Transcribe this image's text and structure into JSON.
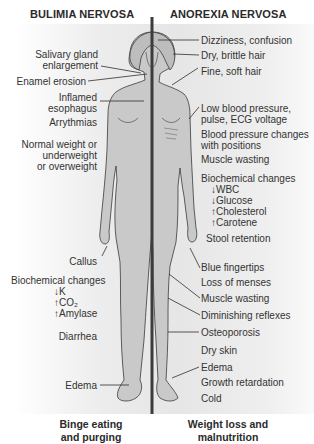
{
  "titles": {
    "left": "BULIMIA NERVOSA",
    "right": "ANOREXIA NERVOSA"
  },
  "bulimia": {
    "labels": [
      {
        "line1": "Salivary gland",
        "line2": "enlargement"
      },
      {
        "line1": "Enamel erosion"
      },
      {
        "line1": "Inflamed",
        "line2": "esophagus"
      },
      {
        "line1": "Arrythmias"
      },
      {
        "line1": "Normal weight or",
        "line2": "underweight",
        "line3": "or overweight"
      },
      {
        "line1": "Callus"
      },
      {
        "line1": "Biochemical changes",
        "items": [
          "↓K",
          "↑CO₂",
          "↑Amylase"
        ]
      },
      {
        "line1": "Diarrhea"
      },
      {
        "line1": "Edema"
      }
    ],
    "caption": {
      "line1": "Binge eating",
      "line2": "and purging"
    }
  },
  "anorexia": {
    "labels": [
      {
        "line1": "Dizziness, confusion"
      },
      {
        "line1": "Dry, brittle hair"
      },
      {
        "line1": "Fine, soft hair"
      },
      {
        "line1": "Low blood pressure,",
        "line2": "pulse, ECG voltage"
      },
      {
        "line1": "Blood pressure changes",
        "line2": "with positions"
      },
      {
        "line1": "Muscle wasting"
      },
      {
        "line1": "Biochemical changes",
        "items": [
          "↓WBC",
          "↓Glucose",
          "↑Cholesterol",
          "↑Carotene"
        ]
      },
      {
        "line1": "Stool retention"
      },
      {
        "line1": "Blue fingertips"
      },
      {
        "line1": "Loss of menses"
      },
      {
        "line1": "Muscle wasting"
      },
      {
        "line1": "Diminishing reflexes"
      },
      {
        "line1": "Osteoporosis"
      },
      {
        "line1": "Dry skin"
      },
      {
        "line1": "Edema"
      },
      {
        "line1": "Growth retardation"
      },
      {
        "line1": "Cold"
      }
    ],
    "caption": {
      "line1": "Weight loss and",
      "line2": "malnutrition"
    }
  },
  "colors": {
    "body_fill": "#c9c9c9",
    "outline": "#3a3a3a",
    "divider": "#3c3c3c",
    "text": "#2a2a2a"
  }
}
